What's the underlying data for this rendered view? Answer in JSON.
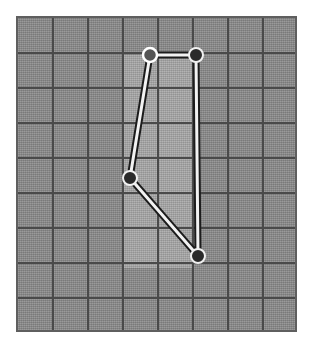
{
  "canvas": {
    "width": 314,
    "height": 349,
    "background_color": "#ffffff"
  },
  "plot": {
    "name": "grid-canvas",
    "frame": {
      "x": 16,
      "y": 16,
      "width": 281,
      "height": 316
    },
    "background_color": "#8b8b8b",
    "border_color": "#5f5f5f",
    "grid": {
      "line_color": "#4a4a4a",
      "columns": 8,
      "rows": 9,
      "cell_width": 35,
      "cell_height": 35,
      "x_positions": [
        35,
        70,
        105,
        140,
        175,
        210,
        245
      ],
      "y_positions": [
        35,
        70,
        105,
        140,
        175,
        210,
        245,
        280
      ]
    },
    "highlight": {
      "name": "selection-band",
      "color": "#a8a8a8",
      "inner_color": "#b0b0b0",
      "x": 105,
      "y": 37,
      "width": 70,
      "height": 213
    }
  },
  "chart_data": {
    "type": "line",
    "title": "",
    "xlabel": "",
    "ylabel": "",
    "grid": true,
    "legend": null,
    "xlim": [
      0,
      281
    ],
    "ylim": [
      0,
      316
    ],
    "nodes": [
      {
        "id": "n1",
        "label": "vertex-1",
        "x": 132,
        "y": 37,
        "state": "selected"
      },
      {
        "id": "n2",
        "label": "vertex-2",
        "x": 178,
        "y": 37,
        "state": "normal"
      },
      {
        "id": "n3",
        "label": "vertex-3",
        "x": 112,
        "y": 160,
        "state": "normal"
      },
      {
        "id": "n4",
        "label": "vertex-4",
        "x": 180,
        "y": 238,
        "state": "normal"
      }
    ],
    "edges": [
      {
        "from": "n2",
        "to": "n1"
      },
      {
        "from": "n1",
        "to": "n3"
      },
      {
        "from": "n3",
        "to": "n4"
      },
      {
        "from": "n4",
        "to": "n2"
      }
    ],
    "path_points": [
      [
        178,
        37
      ],
      [
        132,
        37
      ],
      [
        112,
        160
      ],
      [
        180,
        238
      ],
      [
        178,
        37
      ]
    ],
    "path_outline_color": "#1c1c1c",
    "path_core_color": "#f2f2f2",
    "node_fill_color": "#2a2a2a",
    "node_stroke_color": "#f0f0f0",
    "selected_node_fill_color": "#555555"
  }
}
